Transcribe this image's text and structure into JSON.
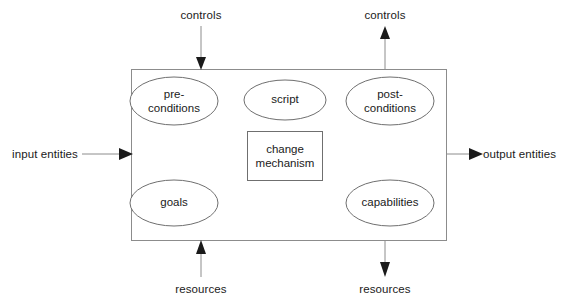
{
  "diagram": {
    "container": {
      "name": "activity-box",
      "x": 131,
      "y": 69,
      "width": 316,
      "height": 172,
      "stroke": "#8c8c8c"
    },
    "nodes": [
      {
        "id": "pre-conditions",
        "label": "pre-\nconditions",
        "shape": "ellipse",
        "cx": 174,
        "cy": 101,
        "rx": 44,
        "ry": 24
      },
      {
        "id": "script",
        "label": "script",
        "shape": "ellipse",
        "cx": 285,
        "cy": 100,
        "rx": 41,
        "ry": 20
      },
      {
        "id": "post-conditions",
        "label": "post-\nconditions",
        "shape": "ellipse",
        "cx": 390,
        "cy": 101,
        "rx": 44,
        "ry": 24
      },
      {
        "id": "change-mechanism",
        "label": "change\nmechanism",
        "shape": "rect",
        "x": 247,
        "y": 131,
        "width": 76,
        "height": 50
      },
      {
        "id": "goals",
        "label": "goals",
        "shape": "ellipse",
        "cx": 174,
        "cy": 203,
        "rx": 44,
        "ry": 23
      },
      {
        "id": "capabilities",
        "label": "capabilities",
        "shape": "ellipse",
        "cx": 390,
        "cy": 203,
        "rx": 44,
        "ry": 23
      }
    ],
    "arrows": [
      {
        "id": "controls-in",
        "label": "controls",
        "direction": "down",
        "label_x": 201,
        "label_y": 9,
        "x1": 201,
        "y1": 26,
        "x2": 201,
        "y2": 69
      },
      {
        "id": "controls-out",
        "label": "controls",
        "direction": "up",
        "label_x": 385,
        "label_y": 9,
        "x1": 385,
        "y1": 69,
        "x2": 385,
        "y2": 26
      },
      {
        "id": "input-entities",
        "label": "input entities",
        "direction": "right",
        "label_x": 12,
        "label_y": 148,
        "x1": 82,
        "y1": 154,
        "x2": 131,
        "y2": 154
      },
      {
        "id": "output-entities",
        "label": "output entities",
        "direction": "right",
        "label_x": 483,
        "label_y": 148,
        "x1": 447,
        "y1": 154,
        "x2": 483,
        "y2": 154
      },
      {
        "id": "resources-in",
        "label": "resources",
        "direction": "up",
        "label_x": 201,
        "label_y": 283,
        "x1": 201,
        "y1": 277,
        "x2": 201,
        "y2": 241
      },
      {
        "id": "resources-out",
        "label": "resources",
        "direction": "down",
        "label_x": 385,
        "label_y": 283,
        "x1": 385,
        "y1": 241,
        "x2": 385,
        "y2": 277
      }
    ]
  }
}
